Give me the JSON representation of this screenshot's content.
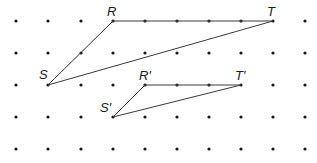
{
  "diagram": {
    "type": "dot-grid-geometry",
    "grid": {
      "columns_x": [
        16,
        48,
        81,
        113,
        145,
        177,
        209,
        241,
        273,
        305
      ],
      "rows_y": [
        21,
        53,
        85,
        117,
        149
      ],
      "dot_color": "#1a1a1a"
    },
    "triangles": [
      {
        "name": "RST",
        "vertices": [
          {
            "label": "R",
            "x": 113,
            "y": 21,
            "lx": 107,
            "ly": 16
          },
          {
            "label": "T",
            "x": 273,
            "y": 21,
            "lx": 267,
            "ly": 16
          },
          {
            "label": "S",
            "x": 48,
            "y": 85,
            "lx": 39,
            "ly": 79
          }
        ]
      },
      {
        "name": "R'S'T'",
        "vertices": [
          {
            "label": "R′",
            "x": 145,
            "y": 85,
            "lx": 139,
            "ly": 80
          },
          {
            "label": "T′",
            "x": 241,
            "y": 85,
            "lx": 235,
            "ly": 80
          },
          {
            "label": "S′",
            "x": 113,
            "y": 117,
            "lx": 100,
            "ly": 112
          }
        ]
      }
    ],
    "line_color": "#3a3a3a"
  },
  "labels": {
    "R": "R",
    "T": "T",
    "S": "S",
    "R_prime": "R′",
    "T_prime": "T′",
    "S_prime": "S′"
  }
}
